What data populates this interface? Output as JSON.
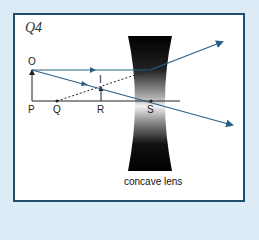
{
  "question_label": "Q4",
  "caption": "concave lens",
  "points": {
    "O": "O",
    "P": "P",
    "Q": "Q",
    "R": "R",
    "S": "S",
    "I": "I"
  },
  "colors": {
    "ray": "#2a5f86",
    "frame": "#1f4e6e",
    "background": "#dcebf5"
  }
}
